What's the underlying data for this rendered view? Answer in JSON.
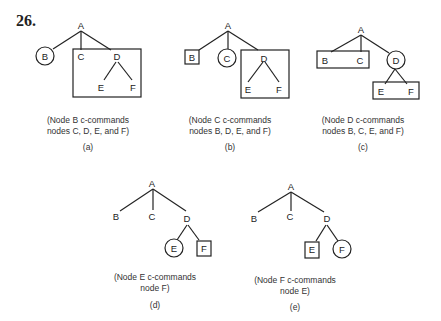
{
  "figure_number": "26.",
  "panels": [
    {
      "id": "a",
      "caption_line1": "(Node B c-commands",
      "caption_line2": "nodes C, D, E, and F)",
      "sublabel": "(a)",
      "circled": "B",
      "boxed": [
        "C",
        "D",
        "E",
        "F"
      ]
    },
    {
      "id": "b",
      "caption_line1": "(Node C c-commands",
      "caption_line2": "nodes B, D, E, and F)",
      "sublabel": "(b)",
      "circled": "C",
      "boxed": [
        "B"
      ],
      "boxed_group": [
        "D",
        "E",
        "F"
      ]
    },
    {
      "id": "c",
      "caption_line1": "(Node D c-commands",
      "caption_line2": "nodes B, C, E, and F)",
      "sublabel": "(c)",
      "circled": "D",
      "boxed_group1": [
        "B",
        "C"
      ],
      "boxed_group2": [
        "E",
        "F"
      ]
    },
    {
      "id": "d",
      "caption_line1": "(Node E c-commands",
      "caption_line2": "node F)",
      "sublabel": "(d)",
      "circled": "E",
      "boxed": [
        "F"
      ]
    },
    {
      "id": "e",
      "caption_line1": "(Node F c-commands",
      "caption_line2": "node E)",
      "sublabel": "(e)",
      "circled": "F",
      "boxed": [
        "E"
      ]
    }
  ],
  "nodes": {
    "A": "A",
    "B": "B",
    "C": "C",
    "D": "D",
    "E": "E",
    "F": "F"
  }
}
